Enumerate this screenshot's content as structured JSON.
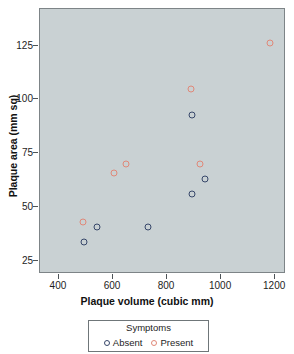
{
  "chart_data": {
    "type": "scatter",
    "title": "",
    "xlabel": "Plaque volume (cubic mm)",
    "ylabel": "Plaque area (mm sq)",
    "xlim": [
      330,
      1240
    ],
    "ylim": [
      19,
      142
    ],
    "xticks": [
      400,
      600,
      800,
      1000,
      1200
    ],
    "xtick_labels": [
      "400",
      "600",
      "800",
      "1000",
      "1200"
    ],
    "yticks": [
      25,
      50,
      75,
      100,
      125
    ],
    "ytick_labels": [
      "25",
      "50",
      "75",
      "100",
      "125"
    ],
    "grid": false,
    "panel_background": "#c9d1d3",
    "legend": {
      "title": "Symptoms",
      "position": "bottom",
      "entries": [
        {
          "label": "Absent",
          "color": "#37476a",
          "marker": "open-circle"
        },
        {
          "label": "Present",
          "color": "#e08878",
          "marker": "open-circle"
        }
      ]
    },
    "series": [
      {
        "name": "Absent",
        "color": "#37476a",
        "points": [
          {
            "x": 493,
            "y": 34
          },
          {
            "x": 541,
            "y": 41
          },
          {
            "x": 730,
            "y": 41
          },
          {
            "x": 893,
            "y": 56
          },
          {
            "x": 941,
            "y": 63
          },
          {
            "x": 893,
            "y": 93
          }
        ]
      },
      {
        "name": "Present",
        "color": "#e08878",
        "points": [
          {
            "x": 489,
            "y": 43
          },
          {
            "x": 604,
            "y": 66
          },
          {
            "x": 648,
            "y": 70
          },
          {
            "x": 922,
            "y": 70
          },
          {
            "x": 889,
            "y": 105
          },
          {
            "x": 1181,
            "y": 126
          }
        ]
      }
    ]
  }
}
